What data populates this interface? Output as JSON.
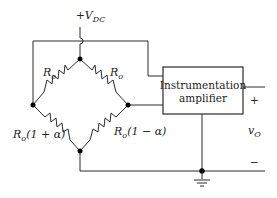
{
  "supply": {
    "prefix": "+",
    "symbol": "V",
    "subscript": "DC"
  },
  "resistors": {
    "top_left": {
      "symbol": "R",
      "subscript": "o",
      "suffix": ""
    },
    "top_right": {
      "symbol": "R",
      "subscript": "o",
      "suffix": ""
    },
    "bottom_left": {
      "symbol": "R",
      "subscript": "o",
      "suffix": "(1 + α)"
    },
    "bottom_right": {
      "symbol": "R",
      "subscript": "o",
      "suffix": "(1 − α)"
    }
  },
  "amplifier": {
    "line1": "Instrumentation",
    "line2": "amplifier"
  },
  "output": {
    "symbol": "v",
    "subscript": "O",
    "plus": "+",
    "minus": "−"
  },
  "colors": {
    "ink": "#2a2a2a",
    "background": "#ffffff"
  }
}
